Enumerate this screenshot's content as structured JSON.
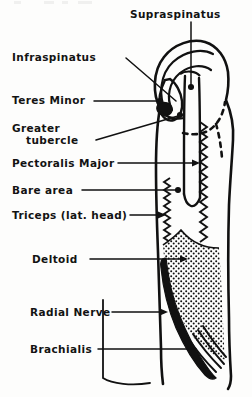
{
  "figure": {
    "view": "anterior",
    "ink_color": "#111111",
    "paper_color": "#fdfdfc"
  },
  "labels": [
    {
      "id": "supraspinatus",
      "text": "Supraspinatus",
      "x": 130,
      "y": 8,
      "leader": "vertical-down",
      "marker": "dot"
    },
    {
      "id": "infraspinatus",
      "text": "Infraspinatus",
      "x": 12,
      "y": 51,
      "leader": "diagonal-down-right",
      "marker": "line"
    },
    {
      "id": "teres-minor",
      "text": "Teres Minor",
      "x": 12,
      "y": 97,
      "leader": "horizontal",
      "marker": "dot"
    },
    {
      "id": "greater-tubercle-line1",
      "text": "Greater",
      "x": 12,
      "y": 124,
      "leader": "none",
      "marker": "none"
    },
    {
      "id": "greater-tubercle-line2",
      "text": "tubercle",
      "x": 12,
      "y": 136,
      "leader": "diagonal-up-right",
      "marker": "dot"
    },
    {
      "id": "pectoralis-major",
      "text": "Pectoralis Major",
      "x": 12,
      "y": 159,
      "leader": "horizontal",
      "marker": "arrow"
    },
    {
      "id": "bare-area",
      "text": "Bare area",
      "x": 12,
      "y": 186,
      "leader": "horizontal",
      "marker": "dot"
    },
    {
      "id": "triceps",
      "text": "Triceps (lat. head)",
      "x": 12,
      "y": 211,
      "leader": "horizontal",
      "marker": "arrow"
    },
    {
      "id": "deltoid",
      "text": "Deltoid",
      "x": 32,
      "y": 255,
      "leader": "horizontal",
      "marker": "arrow"
    },
    {
      "id": "radial-nerve",
      "text": "Radial Nerve",
      "x": 30,
      "y": 308,
      "leader": "horizontal",
      "marker": "arrow"
    },
    {
      "id": "brachialis",
      "text": "Brachialis",
      "x": 30,
      "y": 345,
      "leader": "horizontal",
      "marker": "line"
    }
  ],
  "regions": [
    {
      "id": "humeral-head",
      "style": "outline-arcs"
    },
    {
      "id": "greater-tubercle",
      "style": "outline"
    },
    {
      "id": "bare-area-surface",
      "style": "blank"
    },
    {
      "id": "deltoid-tuberosity",
      "style": "stipple"
    },
    {
      "id": "radial-groove",
      "style": "solid-black"
    },
    {
      "id": "brachialis-origin",
      "style": "solid-black"
    },
    {
      "id": "pectoralis-ridge",
      "style": "serrated-right"
    },
    {
      "id": "triceps-ridge",
      "style": "serrated-left"
    },
    {
      "id": "capsule-margin",
      "style": "dashed"
    }
  ]
}
